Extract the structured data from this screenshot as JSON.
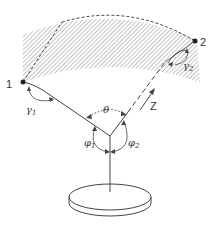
{
  "diagram": {
    "points": [
      {
        "id": "1",
        "label": "1"
      },
      {
        "id": "2",
        "label": "2"
      }
    ],
    "angles": {
      "gamma1": {
        "symbol": "γ",
        "sub": "1"
      },
      "gamma2": {
        "symbol": "γ",
        "sub": "2"
      },
      "theta": {
        "symbol": "θ"
      },
      "phi1": {
        "symbol": "φ",
        "sub": "1"
      },
      "phi2": {
        "symbol": "φ",
        "sub": "2"
      }
    },
    "axis_label": "Z",
    "colors": {
      "line": "#444444",
      "hatch": "#888888",
      "background": "#ffffff"
    }
  }
}
